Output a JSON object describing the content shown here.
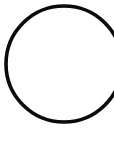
{
  "canvas": {
    "width": 114,
    "height": 141,
    "background_color": "#ffffff",
    "description": "Black circle outline on a plain white background, clipped at the right edge"
  },
  "shape": {
    "name": "circle-outline",
    "type": "circle",
    "center_x": 64,
    "center_y": 64,
    "radius": 58,
    "stroke_color": "#0a0a0a",
    "stroke_width": 3.6,
    "fill": "none",
    "clipped_edge": "right"
  },
  "accessibility": {
    "alt_text": "Circle outline"
  }
}
